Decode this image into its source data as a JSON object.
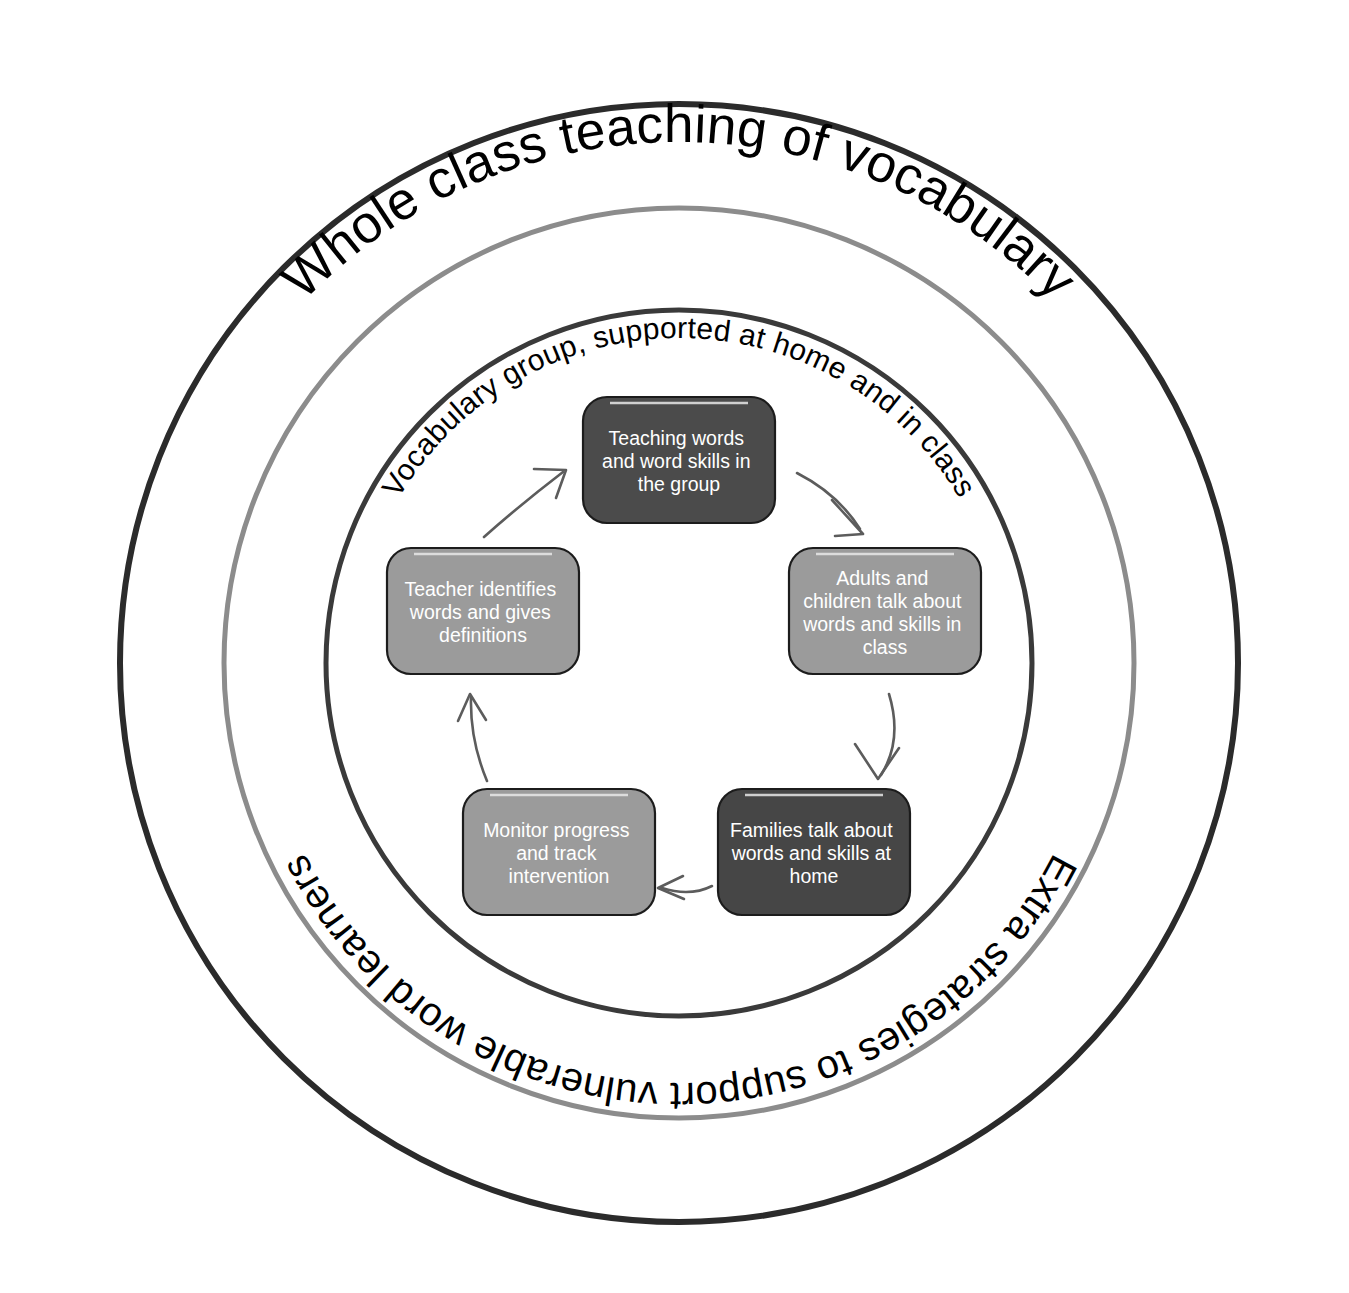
{
  "diagram": {
    "canvas": {
      "width": 1349,
      "height": 1293
    },
    "center": {
      "x": 679,
      "y": 663
    },
    "rings": [
      {
        "id": "outer-ring",
        "name": "whole-class-ring",
        "label": "Whole class teaching of vocabulary",
        "radius": 559,
        "color": "#2b2b2b",
        "stroke_width": 6,
        "label_position": "top",
        "label_font_size": 53
      },
      {
        "id": "middle-ring",
        "name": "extra-strategies-ring",
        "label": "Extra strategies to support vulnerable word learners",
        "radius": 455,
        "color": "#8c8c8c",
        "stroke_width": 5,
        "label_position": "bottom",
        "label_font_size": 40
      },
      {
        "id": "inner-ring",
        "name": "vocabulary-group-ring",
        "label": "Vocabulary group, supported at home and in class",
        "radius": 353,
        "color": "#3a3a3a",
        "stroke_width": 5,
        "label_position": "top",
        "label_font_size": 30
      }
    ],
    "cycle_nodes": [
      {
        "id": "node-teaching-words",
        "name": "teaching-words-box",
        "label": "Teaching words and word skills in the group",
        "lines": [
          "Teaching words",
          "and word skills in",
          "the group"
        ],
        "fill": "#4b4b4b",
        "text_color": "#ffffff",
        "position": {
          "x": 583,
          "y": 397,
          "width": 192,
          "height": 126
        },
        "order": 1
      },
      {
        "id": "node-adults-children",
        "name": "adults-children-talk-box",
        "label": "Adults and children talk about words and skills in class",
        "lines": [
          "Adults and",
          "children talk about",
          "words and skills in",
          "class"
        ],
        "fill": "#9b9b9b",
        "text_color": "#ffffff",
        "position": {
          "x": 789,
          "y": 548,
          "width": 192,
          "height": 126
        },
        "order": 2
      },
      {
        "id": "node-families-talk",
        "name": "families-talk-box",
        "label": "Families talk about words and skills at home",
        "lines": [
          "Families talk about",
          "words and skills at",
          "home"
        ],
        "fill": "#464646",
        "text_color": "#ffffff",
        "position": {
          "x": 718,
          "y": 789,
          "width": 192,
          "height": 126
        },
        "order": 3
      },
      {
        "id": "node-monitor-progress",
        "name": "monitor-progress-box",
        "label": "Monitor progress and track intervention",
        "lines": [
          "Monitor progress",
          "and track",
          "intervention"
        ],
        "fill": "#9b9b9b",
        "text_color": "#ffffff",
        "position": {
          "x": 463,
          "y": 789,
          "width": 192,
          "height": 126
        },
        "order": 4
      },
      {
        "id": "node-teacher-identifies",
        "name": "teacher-identifies-box",
        "label": "Teacher identifies words and gives definitions",
        "lines": [
          "Teacher identifies",
          "words and gives",
          "definitions"
        ],
        "fill": "#9b9b9b",
        "text_color": "#ffffff",
        "position": {
          "x": 387,
          "y": 548,
          "width": 192,
          "height": 126
        },
        "order": 5
      }
    ],
    "arrows": [
      {
        "id": "arrow-1",
        "name": "arrow-teaching-to-adults",
        "from": "node-teaching-words",
        "to": "node-adults-children",
        "color": "#5c5c5c"
      },
      {
        "id": "arrow-2",
        "name": "arrow-adults-to-families",
        "from": "node-adults-children",
        "to": "node-families-talk",
        "color": "#5c5c5c"
      },
      {
        "id": "arrow-3",
        "name": "arrow-families-to-monitor",
        "from": "node-families-talk",
        "to": "node-monitor-progress",
        "color": "#5c5c5c"
      },
      {
        "id": "arrow-4",
        "name": "arrow-monitor-to-teacher",
        "from": "node-monitor-progress",
        "to": "node-teacher-identifies",
        "color": "#5c5c5c"
      },
      {
        "id": "arrow-5",
        "name": "arrow-teacher-to-teaching",
        "from": "node-teacher-identifies",
        "to": "node-teaching-words",
        "color": "#5c5c5c"
      }
    ],
    "colors": {
      "background": "#ffffff",
      "outer_ring": "#2b2b2b",
      "middle_ring": "#8c8c8c",
      "inner_ring": "#3a3a3a",
      "dark_box": "#4b4b4b",
      "light_box": "#9b9b9b",
      "arrow": "#5c5c5c",
      "box_text": "#ffffff",
      "ring_text": "#000000"
    }
  }
}
